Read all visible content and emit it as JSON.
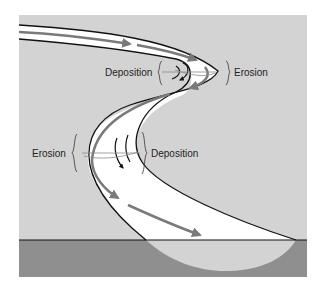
{
  "diagram": {
    "title": "",
    "colors": {
      "page_background": "#ffffff",
      "land": "#d3d3d3",
      "channel": "#ffffff",
      "bank_line": "#111111",
      "flow_arrow": "#7a7a7a",
      "cross_section_ground": "#8f8f8f",
      "cross_section_water": "#d3d3d3"
    },
    "labels": {
      "upper_deposition": "Deposition",
      "upper_erosion": "Erosion",
      "lower_erosion": "Erosion",
      "lower_deposition": "Deposition"
    },
    "icons": {
      "flow": "arrow-icon",
      "bracket": "curly-brace-icon"
    }
  }
}
